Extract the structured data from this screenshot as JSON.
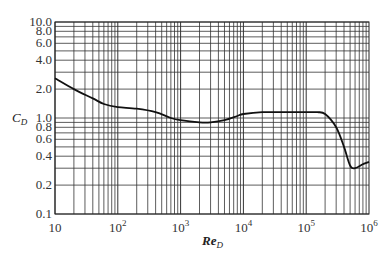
{
  "chart_data": {
    "type": "line",
    "title": "",
    "xlabel": "Re_D",
    "ylabel": "C_D",
    "xscale": "log",
    "yscale": "log",
    "xlim": [
      10,
      1000000
    ],
    "ylim": [
      0.1,
      10.0
    ],
    "grid": true,
    "x_tick_labels": [
      "10",
      "10^2",
      "10^3",
      "10^4",
      "10^5",
      "10^6"
    ],
    "y_tick_labels": [
      "0.1",
      "0.2",
      "0.4",
      "0.6",
      "0.8",
      "1.0",
      "2.0",
      "4.0",
      "6.0",
      "8.0",
      "10.0"
    ],
    "series": [
      {
        "name": "C_D",
        "x": [
          10,
          20,
          40,
          60,
          100,
          200,
          400,
          700,
          1000,
          2000,
          3000,
          5000,
          8000,
          10000,
          20000,
          50000,
          100000,
          150000,
          200000,
          300000,
          400000,
          500000,
          600000,
          800000,
          1000000
        ],
        "y": [
          2.6,
          2.0,
          1.6,
          1.4,
          1.3,
          1.25,
          1.15,
          1.0,
          0.95,
          0.9,
          0.9,
          0.95,
          1.05,
          1.1,
          1.15,
          1.15,
          1.15,
          1.15,
          1.1,
          0.8,
          0.5,
          0.32,
          0.3,
          0.33,
          0.35
        ]
      }
    ]
  },
  "labels": {
    "ylabel_main": "C",
    "ylabel_sub": "D",
    "xlabel_main": "Re",
    "xlabel_sub": "D"
  }
}
